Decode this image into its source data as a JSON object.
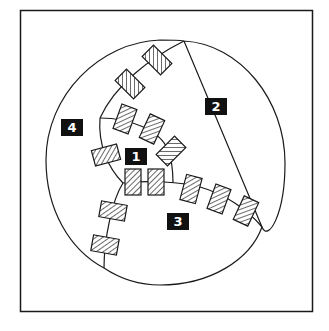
{
  "diagram": {
    "regions": [
      {
        "id": "1",
        "label": "1"
      },
      {
        "id": "2",
        "label": "2"
      },
      {
        "id": "3",
        "label": "3"
      },
      {
        "id": "4",
        "label": "4"
      }
    ],
    "colors": {
      "stroke": "#1a1a1a",
      "label_bg": "#111111",
      "label_text": "#ffffff",
      "background": "#ffffff"
    },
    "marker_count": 17
  },
  "caption": {
    "text": ""
  }
}
